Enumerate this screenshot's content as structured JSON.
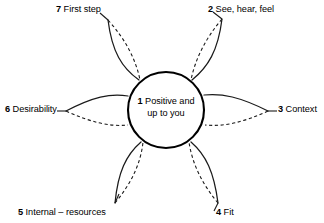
{
  "diagram": {
    "type": "flower-petal-diagram",
    "center": {
      "number": "1",
      "text": "Positive and up to you",
      "line1": "1 Positive and",
      "line2": "up to you"
    },
    "petals": [
      {
        "number": "2",
        "label": "See, hear, feel",
        "name": "petal-see-hear-feel",
        "angle_deg": -55
      },
      {
        "number": "3",
        "label": "Context",
        "name": "petal-context",
        "angle_deg": 0
      },
      {
        "number": "4",
        "label": "Fit",
        "name": "petal-fit",
        "angle_deg": 55
      },
      {
        "number": "5",
        "label": "Internal – resources",
        "name": "petal-internal-resources",
        "angle_deg": 125
      },
      {
        "number": "6",
        "label": "Desirability",
        "name": "petal-desirability",
        "angle_deg": 180
      },
      {
        "number": "7",
        "label": "First step",
        "name": "petal-first-step",
        "angle_deg": -125
      }
    ],
    "style": {
      "stroke_color": "#1a1a1a",
      "core_stroke_color": "#000000",
      "background": "#ffffff",
      "petal_inner_line": "dashed",
      "petal_outer_line": "solid"
    }
  }
}
